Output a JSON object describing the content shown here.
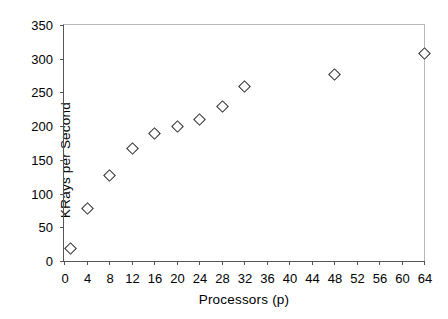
{
  "chart_data": {
    "type": "scatter",
    "title": "",
    "xlabel": "Processors (p)",
    "ylabel": "KRays per Second",
    "xlim": [
      0,
      64
    ],
    "ylim": [
      0,
      350
    ],
    "xticks": [
      0,
      4,
      8,
      12,
      16,
      20,
      24,
      28,
      32,
      36,
      40,
      44,
      48,
      52,
      56,
      60,
      64
    ],
    "yticks": [
      0,
      50,
      100,
      150,
      200,
      250,
      300,
      350
    ],
    "grid": false,
    "legend": null,
    "marker": "open-diamond",
    "marker_color": "#2b2b2b",
    "series": [
      {
        "name": "KRays per Second",
        "points": [
          {
            "x": 1,
            "y": 20
          },
          {
            "x": 4,
            "y": 78
          },
          {
            "x": 8,
            "y": 128
          },
          {
            "x": 12,
            "y": 168
          },
          {
            "x": 16,
            "y": 190
          },
          {
            "x": 20,
            "y": 200
          },
          {
            "x": 24,
            "y": 210
          },
          {
            "x": 28,
            "y": 230
          },
          {
            "x": 32,
            "y": 259
          },
          {
            "x": 48,
            "y": 278
          },
          {
            "x": 64,
            "y": 308
          }
        ]
      }
    ]
  }
}
